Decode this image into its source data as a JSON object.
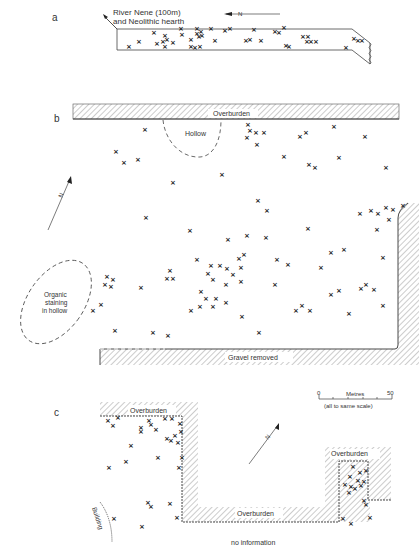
{
  "figure": {
    "panels": [
      {
        "id": "a",
        "label": "a",
        "annotations": {
          "river_line1": "River Nene (100m)",
          "river_line2": "and Neolithic hearth",
          "north": "N"
        }
      },
      {
        "id": "b",
        "label": "b",
        "annotations": {
          "overburden": "Overburden",
          "hollow": "Hollow",
          "organic1": "Organic",
          "organic2": "staining",
          "organic3": "in hollow",
          "gravel_removed": "Gravel removed",
          "north": "N"
        }
      },
      {
        "id": "c",
        "label": "c",
        "annotations": {
          "overburden_top": "Overburden",
          "overburden_bottom": "Overburden",
          "overburden_right": "Overburden",
          "building": "Building",
          "no_information": "no information",
          "north": "N"
        }
      }
    ],
    "scale_bar": {
      "start": "0",
      "end": "50",
      "unit": "Metres",
      "note": "(all to same scale)"
    },
    "find_marker": "×"
  }
}
